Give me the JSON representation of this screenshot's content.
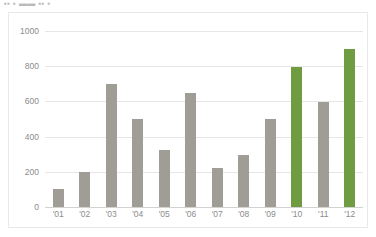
{
  "title_fragment": "▪▪ ▪ ▬▬ ▪▪ ▪",
  "colors": {
    "bar_default": "#a09c96",
    "bar_highlight": "#6f9b41",
    "gridline": "#e6e6e6",
    "axis": "#d2d2d2",
    "tick_text": "#8c8c8c",
    "frame_border": "#e8e8e8",
    "background": "#ffffff"
  },
  "chart_data": {
    "type": "bar",
    "title": "",
    "xlabel": "",
    "ylabel": "",
    "categories": [
      "'01",
      "'02",
      "'03",
      "'04",
      "'05",
      "'06",
      "'07",
      "'08",
      "'09",
      "'10",
      "'11",
      "'12"
    ],
    "values": [
      100,
      200,
      700,
      500,
      325,
      645,
      220,
      295,
      500,
      795,
      595,
      900
    ],
    "highlight_categories": [
      "'10",
      "'12"
    ],
    "bar_colors": [
      "#a09c96",
      "#a09c96",
      "#a09c96",
      "#a09c96",
      "#a09c96",
      "#a09c96",
      "#a09c96",
      "#a09c96",
      "#a09c96",
      "#6f9b41",
      "#a09c96",
      "#6f9b41"
    ],
    "ylim": [
      0,
      1000
    ],
    "yticks": [
      0,
      200,
      400,
      600,
      800,
      1000
    ],
    "ytick_labels": [
      "0",
      "200",
      "400",
      "600",
      "800",
      "1000"
    ],
    "grid": true,
    "legend": false,
    "legend_position": "none"
  }
}
